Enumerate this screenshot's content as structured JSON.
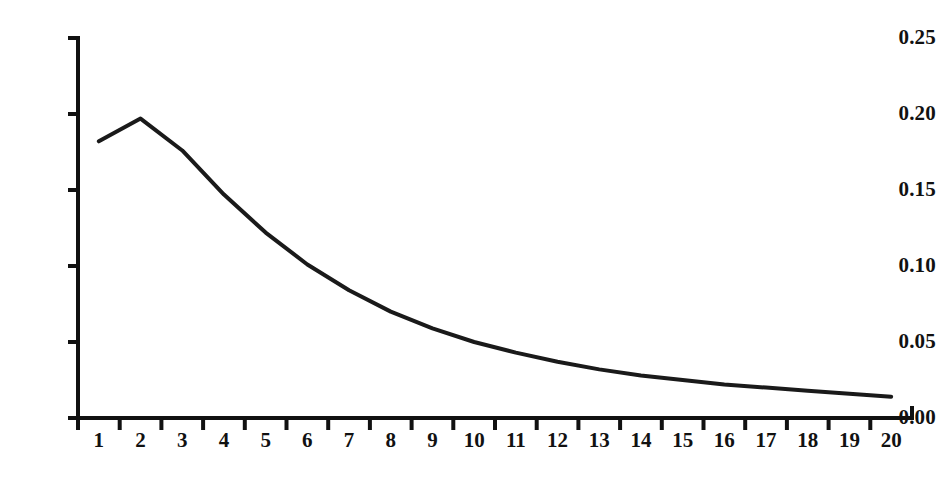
{
  "chart_data": {
    "type": "line",
    "title": "",
    "subtitle": "",
    "xlabel": "",
    "ylabel": "",
    "x": [
      1,
      2,
      3,
      4,
      5,
      6,
      7,
      8,
      9,
      10,
      11,
      12,
      13,
      14,
      15,
      16,
      17,
      18,
      19,
      20
    ],
    "categories": [
      "1",
      "2",
      "3",
      "4",
      "5",
      "6",
      "7",
      "8",
      "9",
      "10",
      "11",
      "12",
      "13",
      "14",
      "15",
      "16",
      "17",
      "18",
      "19",
      "20"
    ],
    "values": [
      0.182,
      0.197,
      0.176,
      0.147,
      0.122,
      0.101,
      0.084,
      0.07,
      0.059,
      0.05,
      0.043,
      0.037,
      0.032,
      0.028,
      0.025,
      0.022,
      0.02,
      0.018,
      0.016,
      0.014
    ],
    "series": [
      {
        "name": "distribution",
        "values": [
          0.182,
          0.197,
          0.176,
          0.147,
          0.122,
          0.101,
          0.084,
          0.07,
          0.059,
          0.05,
          0.043,
          0.037,
          0.032,
          0.028,
          0.025,
          0.022,
          0.02,
          0.018,
          0.016,
          0.014
        ],
        "color": "#1a1a1a"
      }
    ],
    "ylim": [
      0.0,
      0.25
    ],
    "xlim": [
      0.5,
      20.5
    ],
    "ytick_labels": [
      "0.00",
      "0.05",
      "0.10",
      "0.15",
      "0.20",
      "0.25"
    ],
    "ytick_values": [
      0.0,
      0.05,
      0.1,
      0.15,
      0.2,
      0.25
    ],
    "xtick_labels": [
      "1",
      "2",
      "3",
      "4",
      "5",
      "6",
      "7",
      "8",
      "9",
      "10",
      "11",
      "12",
      "13",
      "14",
      "15",
      "16",
      "17",
      "18",
      "19",
      "20"
    ],
    "grid": false,
    "legend": false,
    "legend_position": "none",
    "line_color": "#1a1a1a",
    "axis_color": "#111111",
    "background_color": "#ffffff",
    "annotations": []
  }
}
